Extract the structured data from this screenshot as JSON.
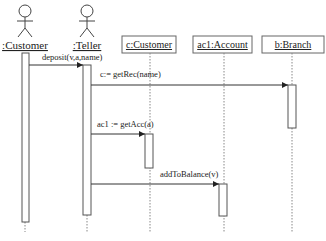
{
  "diagram": {
    "type": "sequence",
    "actors": [
      {
        "id": "customer",
        "label": ":Customer",
        "x": 25
      },
      {
        "id": "teller",
        "label": ":Teller",
        "x": 87
      }
    ],
    "objects": [
      {
        "id": "c",
        "label": "c:Customer",
        "x": 150
      },
      {
        "id": "ac1",
        "label": "ac1:Account",
        "x": 223
      },
      {
        "id": "b",
        "label": "b:Branch",
        "x": 292
      }
    ],
    "messages": [
      {
        "label": "deposit(v,a,name)",
        "from": "customer",
        "to": "teller"
      },
      {
        "label": "c:= getRec(name)",
        "from": "teller",
        "to": "b"
      },
      {
        "label": "ac1 := getAcc(a)",
        "from": "teller",
        "to": "c"
      },
      {
        "label": "addToBalance(v)",
        "from": "teller",
        "to": "ac1"
      }
    ],
    "colors": {
      "line": "#333333",
      "dashed": "#777777",
      "box_border": "#555555"
    }
  }
}
